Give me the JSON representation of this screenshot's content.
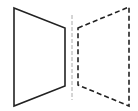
{
  "diagram": {
    "colors": {
      "background": "#ffffff",
      "shape": "#222222",
      "mirror": "#aaaaaa"
    },
    "original_shape": {
      "style": "solid",
      "points": "14,8 65,28 65,86 14,106"
    },
    "mirror_line": {
      "style": "dashed",
      "x1": 72,
      "y1": 15,
      "x2": 72,
      "y2": 100
    },
    "reflected_shape": {
      "style": "dashed",
      "points": "78,28 129,7 129,106 78,85"
    }
  }
}
